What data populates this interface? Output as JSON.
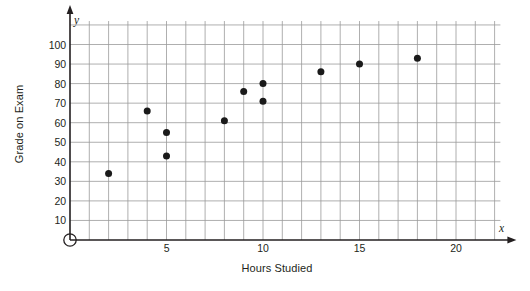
{
  "chart_data": {
    "type": "scatter",
    "title": "",
    "xlabel": "Hours Studied",
    "ylabel": "Grade on Exam",
    "x_axis_variable": "x",
    "y_axis_variable": "y",
    "xlim": [
      0,
      22.5
    ],
    "ylim": [
      0,
      112
    ],
    "x_ticks": [
      5,
      10,
      15,
      20
    ],
    "x_tick_labels": [
      "5",
      "10",
      "15",
      "20"
    ],
    "y_ticks": [
      10,
      20,
      30,
      40,
      50,
      60,
      70,
      80,
      90,
      100
    ],
    "y_tick_labels": [
      "10",
      "20",
      "30",
      "40",
      "50",
      "60",
      "70",
      "80",
      "90",
      "100"
    ],
    "grid": true,
    "grid_x_step": 1,
    "grid_y_step": 10,
    "legend": false,
    "legend_position": "none",
    "origin_marker": "open-circle",
    "points": [
      {
        "x": 2,
        "y": 34
      },
      {
        "x": 4,
        "y": 66
      },
      {
        "x": 5,
        "y": 55
      },
      {
        "x": 5,
        "y": 43
      },
      {
        "x": 8,
        "y": 61
      },
      {
        "x": 9,
        "y": 76
      },
      {
        "x": 10,
        "y": 80
      },
      {
        "x": 10,
        "y": 71
      },
      {
        "x": 13,
        "y": 86
      },
      {
        "x": 15,
        "y": 90
      },
      {
        "x": 18,
        "y": 93
      }
    ]
  },
  "colors": {
    "background": "#ffffff",
    "grid": "#9a9a9a",
    "axis": "#231f20",
    "point": "#1a1a1a",
    "text": "#231f20"
  }
}
